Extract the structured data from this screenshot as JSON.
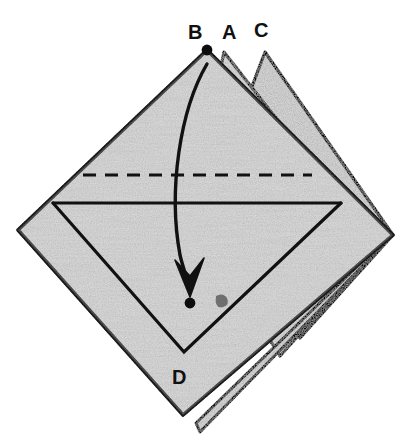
{
  "figure": {
    "background_color": "#ffffff",
    "paper_color": "#d9d9d9",
    "paper_shadow_color": "#c4c4c4",
    "ink_color": "#111111",
    "labels": [
      {
        "id": "B",
        "text": "B",
        "x": 188,
        "y": 22
      },
      {
        "id": "A",
        "text": "A",
        "x": 222,
        "y": 22
      },
      {
        "id": "C",
        "text": "C",
        "x": 254,
        "y": 20
      },
      {
        "id": "D",
        "text": "D",
        "x": 172,
        "y": 367
      }
    ],
    "points": [
      {
        "id": "dot-B",
        "name": "vertex-dot-b",
        "cx": 207,
        "cy": 50,
        "r": 5
      },
      {
        "id": "dot-D",
        "name": "target-dot-d",
        "cx": 190,
        "cy": 303,
        "r": 5
      }
    ],
    "arrow": {
      "name": "fold-arrow",
      "from": "B",
      "to": "D",
      "path": "M 207 64 C 180 110, 168 190, 180 255 C 183 268, 187 278, 189 286",
      "head_path": "M 176 262 L 190 296 L 203 260 L 190 277 Z",
      "stroke_width": 3.4
    },
    "crease_dashed": {
      "name": "valley-crease-dashed",
      "x1": 83,
      "y1": 175,
      "x2": 312,
      "y2": 175,
      "dash": "13 9",
      "stroke_width": 3
    },
    "crease_solid": {
      "name": "horizontal-crease-solid",
      "x1": 53,
      "y1": 203,
      "x2": 341,
      "y2": 203,
      "stroke_width": 3
    },
    "outline_notes": [
      "outer diamond apex B (207,50)",
      "left corner (18,230)",
      "bottom corner (183,415)",
      "right corner (393,235)",
      "second flap apex A (224,52)",
      "third flap apex C (265,52)"
    ]
  }
}
